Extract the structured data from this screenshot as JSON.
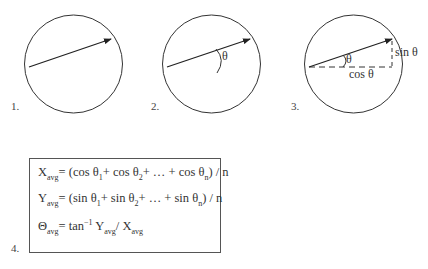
{
  "panels": [
    {
      "label": "1."
    },
    {
      "label": "2.",
      "angle_label": "θ"
    },
    {
      "label": "3.",
      "angle_label": "θ",
      "sin_label": "sin θ",
      "cos_label": "cos θ"
    }
  ],
  "formulas": {
    "label": "4.",
    "x_avg": {
      "lhs": "X",
      "lhs_sub": "avg",
      "rhs_parts": [
        "= (cos θ",
        "1",
        "+ cos θ",
        "2",
        "+ … + cos θ",
        "n",
        ") / n"
      ]
    },
    "y_avg": {
      "lhs": "Y",
      "lhs_sub": "avg",
      "rhs_parts": [
        "= (sin θ",
        "1",
        "+ sin θ",
        "2",
        "+ … + sin θ",
        "n",
        ") / n"
      ]
    },
    "theta_avg": {
      "lhs": "Θ",
      "lhs_sub": "avg",
      "eq": "= tan",
      "sup": "−1",
      "y": " Y",
      "y_sub": "avg",
      "slash": "/ X",
      "x_sub": "avg"
    }
  },
  "colors": {
    "stroke": "#333333",
    "text": "#333333",
    "box_border": "#555555"
  }
}
